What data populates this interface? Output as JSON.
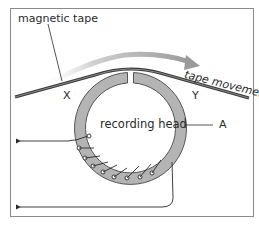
{
  "diagram": {
    "labels": {
      "tape": "magnetic tape",
      "movement": "tape movement",
      "head": "recording head",
      "x": "X",
      "y": "Y",
      "a": "A"
    },
    "colors": {
      "ring_fill": "#b4b4b4",
      "ring_stroke": "#555555",
      "tape": "#3a3a3a",
      "arrow": "#9a9a9a",
      "frame": "#8a8a8a",
      "wire": "#2a2a2a"
    },
    "components": [
      "magnetic tape",
      "recording head ring with gap",
      "coil windings",
      "two wire leads with arrows",
      "tape movement arrow"
    ]
  }
}
